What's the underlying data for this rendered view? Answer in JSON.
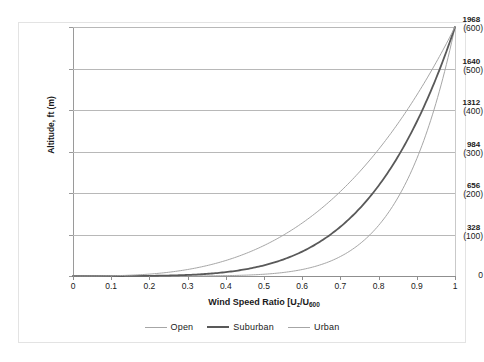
{
  "chart_data": {
    "type": "line",
    "title": "",
    "xlabel": "Wind Speed Ratio [U₂/U₆₀₀",
    "xlabel_parts": {
      "prefix": "Wind Speed Ratio [U",
      "sub1": "z",
      "mid": "/U",
      "sub2": "600"
    },
    "ylabel": "Altitude, ft (m)",
    "xlim": [
      0,
      1
    ],
    "ylim": [
      0,
      600
    ],
    "grid": true,
    "legend_position": "bottom",
    "x_ticks": [
      "0",
      "0.1",
      "0.2",
      "0.3",
      "0.4",
      "0.5",
      "0.6",
      "0.7",
      "0.8",
      "0.9",
      "1"
    ],
    "x_tick_values": [
      0,
      0.1,
      0.2,
      0.3,
      0.4,
      0.5,
      0.6,
      0.7,
      0.8,
      0.9,
      1
    ],
    "y_ticks_ft": [
      "1968",
      "1640",
      "1312",
      "984",
      "656",
      "328",
      "0"
    ],
    "y_ticks_m": [
      "(600)",
      "(500)",
      "(400)",
      "(300)",
      "(200)",
      "(100)",
      ""
    ],
    "y_tick_values_m": [
      600,
      500,
      400,
      300,
      200,
      100,
      0
    ],
    "series": [
      {
        "name": "Open",
        "color": "#a6a6a6",
        "width": 1.0,
        "alpha_exponent": 0.14,
        "x": [
          0.0,
          0.1,
          0.2,
          0.25,
          0.3,
          0.35,
          0.4,
          0.45,
          0.5,
          0.55,
          0.6,
          0.65,
          0.7,
          0.75,
          0.8,
          0.85,
          0.9,
          0.95,
          1.0
        ],
        "y": [
          0.0,
          0.0,
          0.1,
          0.3,
          0.8,
          2.0,
          4.4,
          9.0,
          17.1,
          30.5,
          51.7,
          83.7,
          130.2,
          195.4,
          284.7,
          404.0,
          560.0,
          759.0,
          600.0
        ],
        "y_plot": [
          0.0,
          0.0,
          0.1,
          0.3,
          0.8,
          2.0,
          4.4,
          9.0,
          17.1,
          30.5,
          51.7,
          83.7,
          130.2,
          195.4,
          284.7,
          404.0,
          560.0,
          600.0,
          600.0
        ]
      },
      {
        "name": "Suburban",
        "color": "#595959",
        "width": 1.8,
        "alpha_exponent": 0.22,
        "x": [
          0.0,
          0.1,
          0.2,
          0.3,
          0.35,
          0.4,
          0.45,
          0.5,
          0.55,
          0.6,
          0.65,
          0.7,
          0.75,
          0.8,
          0.85,
          0.9,
          0.95,
          1.0
        ],
        "y": [
          0.0,
          0.0,
          0.0,
          0.1,
          0.3,
          0.8,
          1.8,
          3.8,
          7.6,
          14.3,
          25.6,
          43.7,
          71.8,
          114.0,
          175.4,
          262.5,
          383.0,
          600.0
        ],
        "y_plot": [
          0.0,
          0.0,
          0.0,
          0.1,
          0.3,
          0.8,
          1.8,
          3.8,
          7.6,
          14.3,
          25.6,
          43.7,
          71.8,
          114.0,
          175.4,
          262.5,
          383.0,
          600.0
        ]
      },
      {
        "name": "Urban",
        "color": "#a6a6a6",
        "width": 1.0,
        "alpha_exponent": 0.33,
        "x": [
          0.0,
          0.1,
          0.2,
          0.3,
          0.4,
          0.45,
          0.5,
          0.55,
          0.6,
          0.65,
          0.7,
          0.75,
          0.8,
          0.85,
          0.9,
          0.95,
          1.0
        ],
        "y": [
          0.0,
          0.0,
          0.0,
          0.0,
          0.1,
          0.2,
          0.5,
          1.3,
          2.9,
          6.1,
          12.0,
          22.6,
          40.7,
          70.6,
          118.8,
          194.4,
          600.0
        ],
        "y_plot": [
          0.0,
          0.0,
          0.0,
          0.0,
          0.1,
          0.2,
          0.5,
          1.3,
          2.9,
          6.1,
          12.0,
          22.6,
          40.7,
          70.6,
          118.8,
          194.4,
          600.0
        ]
      }
    ],
    "legend": [
      {
        "label": "Open",
        "color": "#a6a6a6",
        "width": 1.0
      },
      {
        "label": "Suburban",
        "color": "#595959",
        "width": 2.0
      },
      {
        "label": "Urban",
        "color": "#a6a6a6",
        "width": 1.0
      }
    ]
  }
}
